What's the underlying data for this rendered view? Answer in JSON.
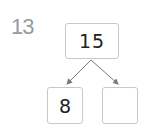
{
  "question": {
    "number": "13"
  },
  "number_bond": {
    "whole": "15",
    "part_left": "8",
    "part_right": ""
  },
  "colors": {
    "label": "#9a9a9a",
    "border": "#c8c8c8",
    "arrow": "#777777",
    "text": "#222222"
  }
}
